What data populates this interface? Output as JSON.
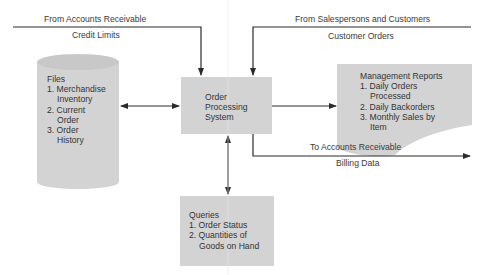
{
  "flows": {
    "accounts_receivable_in": {
      "source": "From Accounts Receivable",
      "data": "Credit Limits"
    },
    "customers_in": {
      "source": "From Salespersons and Customers",
      "data": "Customer Orders"
    },
    "accounts_receivable_out": {
      "destination": "To Accounts Receivable",
      "data": "Billing Data"
    }
  },
  "nodes": {
    "process": {
      "lines": [
        "Order",
        "Processing",
        "System"
      ]
    },
    "files": {
      "title": "Files",
      "items": [
        {
          "num": "1.",
          "line1": "Merchandise",
          "line2": "Inventory"
        },
        {
          "num": "2.",
          "line1": "Current",
          "line2": "Order"
        },
        {
          "num": "3.",
          "line1": "Order",
          "line2": "History"
        }
      ]
    },
    "reports": {
      "title": "Management Reports",
      "items": [
        {
          "num": "1.",
          "line1": "Daily Orders",
          "line2": "Processed"
        },
        {
          "num": "2.",
          "line1": "Daily Backorders",
          "line2": ""
        },
        {
          "num": "3.",
          "line1": "Monthly Sales by",
          "line2": "Item"
        }
      ]
    },
    "queries": {
      "title": "Queries",
      "items": [
        {
          "num": "1.",
          "line1": "Order Status",
          "line2": ""
        },
        {
          "num": "2.",
          "line1": "Quantities of",
          "line2": "Goods on Hand"
        }
      ]
    }
  },
  "colors": {
    "fill": "#d3d3d3",
    "line": "#2b2b2b",
    "text": "#3a3a3a"
  }
}
